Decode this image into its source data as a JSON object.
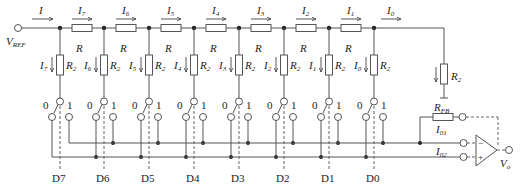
{
  "diagram": {
    "type": "R-2R ladder DAC (inverted T network, 8-bit)",
    "vref_label": "V",
    "vref_sub": "REF",
    "input_current": "I",
    "series_resistor_label": "R",
    "shunt_resistor_label": "R",
    "shunt_resistor_sub": "2",
    "branches": [
      {
        "bit": "D7",
        "series_current": "I",
        "series_sub": "7",
        "shunt_current": "I",
        "shunt_sub": "7"
      },
      {
        "bit": "D6",
        "series_current": "I",
        "series_sub": "6",
        "shunt_current": "I",
        "shunt_sub": "6"
      },
      {
        "bit": "D5",
        "series_current": "I",
        "series_sub": "5",
        "shunt_current": "I",
        "shunt_sub": "5"
      },
      {
        "bit": "D4",
        "series_current": "I",
        "series_sub": "4",
        "shunt_current": "I",
        "shunt_sub": "4"
      },
      {
        "bit": "D3",
        "series_current": "I",
        "series_sub": "3",
        "shunt_current": "I",
        "shunt_sub": "3"
      },
      {
        "bit": "D2",
        "series_current": "I",
        "series_sub": "2",
        "shunt_current": "I",
        "shunt_sub": "2"
      },
      {
        "bit": "D1",
        "series_current": "I",
        "series_sub": "1",
        "shunt_current": "I",
        "shunt_sub": "1"
      },
      {
        "bit": "D0",
        "series_current": "I",
        "series_sub": "0",
        "shunt_current": "I",
        "shunt_sub": "0"
      }
    ],
    "switch_pos_0": "0",
    "switch_pos_1": "1",
    "terminator_label": "R",
    "terminator_sub": "2",
    "feedback_label": "R",
    "feedback_sub": "FB",
    "out_current_1": "I",
    "out_current_1_sub": "01",
    "out_current_2": "I",
    "out_current_2_sub": "02",
    "opamp_minus": "−",
    "opamp_plus": "+",
    "output_label": "V",
    "output_sub": "o"
  }
}
